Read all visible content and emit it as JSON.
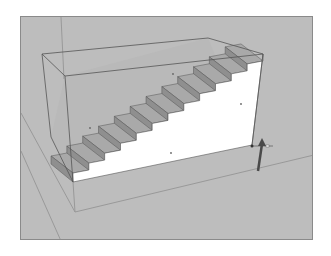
{
  "viewport": {
    "background": "#bdbdbd",
    "border_color": "#8a8a8a",
    "tool": "push-pull-move-cursor"
  },
  "scene": {
    "object": "staircase",
    "step_count": 12,
    "colors": {
      "ground_line": "#999999",
      "edge": "#555555",
      "tread": "#a9a9a9",
      "riser": "#8f8f8f",
      "side_face": "#ffffff",
      "box_inner": "#b9b9b9",
      "cursor": "#4a4a4a"
    },
    "box": {
      "front_top_left": [
        41,
        53
      ],
      "back_top_left": [
        64,
        75
      ],
      "back_top_right": [
        207,
        37
      ],
      "front_top_right": [
        262,
        53
      ],
      "front_bottom_right": [
        251,
        144
      ],
      "front_bottom_left": [
        72,
        181
      ],
      "back_bottom_left": [
        50,
        136
      ]
    },
    "ground_lines": [
      [
        [
          74,
          211
        ],
        [
          313,
          154
        ]
      ],
      [
        [
          74,
          211
        ],
        [
          72,
          181
        ]
      ],
      [
        [
          20,
          112
        ],
        [
          74,
          211
        ]
      ],
      [
        [
          20,
          150
        ],
        [
          60,
          240
        ]
      ],
      [
        [
          60,
          16
        ],
        [
          63,
          78
        ]
      ]
    ],
    "vertex_markers": [
      [
        172,
        73
      ],
      [
        240,
        103
      ],
      [
        170,
        152
      ],
      [
        89,
        127
      ]
    ],
    "cursor": {
      "tip": [
        261,
        137
      ],
      "tail": [
        257,
        170
      ],
      "cross_y": 145,
      "cross_x": [
        252,
        272
      ]
    }
  }
}
